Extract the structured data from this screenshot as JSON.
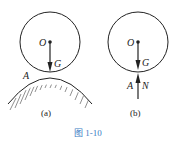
{
  "figure": {
    "caption": "图 1-10",
    "caption_color": "#3a7cc4",
    "panels": [
      {
        "id": "a",
        "label": "(a)",
        "center_label": "O",
        "weight_label": "G",
        "contact_label": "A",
        "surface": "convex hatched surface"
      },
      {
        "id": "b",
        "label": "(b)",
        "center_label": "O",
        "weight_label": "G",
        "contact_label": "A",
        "normal_label": "N"
      }
    ]
  }
}
